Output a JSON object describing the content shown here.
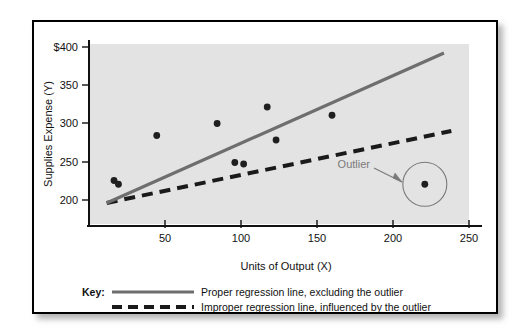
{
  "figure": {
    "title": "",
    "frame_border_color": "#000000",
    "plot_background_color": "#e3e3e3",
    "axis_color": "#111111",
    "proper_line_color": "#6e6e6e",
    "improper_line_color": "#1a1a1a",
    "point_color": "#1f1f1f",
    "annotation_color": "#7a7a7a"
  },
  "chart_data": {
    "type": "scatter",
    "title": "",
    "xlabel": "Units of Output (X)",
    "ylabel": "Supplies Expense (Y)",
    "xlim": [
      0,
      258
    ],
    "ylim": [
      175,
      415
    ],
    "grid": false,
    "xticks": [
      50,
      100,
      150,
      200,
      250
    ],
    "xticklabels": [
      "50",
      "100",
      "150",
      "200",
      "250"
    ],
    "yticks": [
      200,
      250,
      300,
      350,
      400
    ],
    "yticklabels": [
      "200",
      "250",
      "300",
      "350",
      "$400"
    ],
    "points": [
      {
        "x": 17,
        "y": 233,
        "label": ""
      },
      {
        "x": 20,
        "y": 228,
        "label": ""
      },
      {
        "x": 46,
        "y": 293,
        "label": ""
      },
      {
        "x": 87,
        "y": 309,
        "label": ""
      },
      {
        "x": 99,
        "y": 257,
        "label": ""
      },
      {
        "x": 105,
        "y": 255,
        "label": ""
      },
      {
        "x": 121,
        "y": 331,
        "label": ""
      },
      {
        "x": 127,
        "y": 287,
        "label": ""
      },
      {
        "x": 165,
        "y": 320,
        "label": ""
      },
      {
        "x": 228,
        "y": 228,
        "label": "outlier"
      }
    ],
    "series": [
      {
        "name": "Proper regression line, excluding the outlier",
        "type": "line",
        "style": "solid",
        "color": "#6e6e6e",
        "x": [
          12,
          241
        ],
        "y": [
          203,
          403
        ]
      },
      {
        "name": "Improper regression line, influenced by the outlier",
        "type": "line",
        "style": "dashed",
        "color": "#1a1a1a",
        "x": [
          12,
          246
        ],
        "y": [
          203,
          299
        ]
      }
    ],
    "annotations": [
      {
        "text": "Outlier",
        "x": 205,
        "y": 250,
        "arrow_to_x": 222,
        "arrow_to_y": 236,
        "circle": {
          "x": 228,
          "y": 228,
          "radius_px": 22
        }
      }
    ],
    "legend_position": "below-axes"
  },
  "axes": {
    "y_axis_label": "Supplies Expense (Y)",
    "y_axis_label_italic_suffix": "Y",
    "x_axis_label": "Units of Output (X)",
    "x_axis_label_italic_suffix": "X"
  },
  "legend": {
    "key_label": "Key:",
    "entries": [
      {
        "style": "solid",
        "color": "#6e6e6e",
        "label": "Proper regression line, excluding the outlier"
      },
      {
        "style": "dashed",
        "color": "#1a1a1a",
        "label": "Improper regression line, influenced by the outlier"
      }
    ]
  }
}
